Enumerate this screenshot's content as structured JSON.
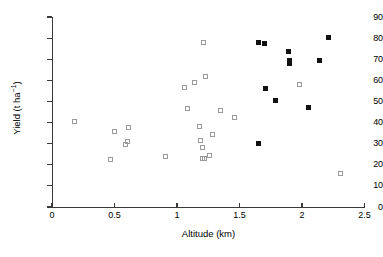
{
  "chart_data": {
    "type": "scatter",
    "title": "",
    "xlabel": "Altitude (km)",
    "ylabel": "Yield (t ha-1)",
    "ylabel_base": "Yield (t ha",
    "ylabel_sup": "−1",
    "ylabel_tail": ")",
    "xlim": [
      0,
      2.5
    ],
    "ylim": [
      0,
      90
    ],
    "xticks": [
      0,
      0.5,
      1,
      1.5,
      2,
      2.5
    ],
    "xtick_labels": [
      "0",
      "0.5",
      "1",
      "1.5",
      "2",
      "2.5"
    ],
    "yticks": [
      0,
      10,
      20,
      30,
      40,
      50,
      60,
      70,
      80,
      90
    ],
    "ytick_labels": [
      "0",
      "10",
      "20",
      "30",
      "40",
      "50",
      "60",
      "70",
      "80",
      "90"
    ],
    "grid": false,
    "legend": null,
    "series": [
      {
        "name": "open-squares",
        "marker": "open square",
        "color": "#9a9a9a",
        "points": [
          [
            0.18,
            40.5
          ],
          [
            0.47,
            22.6
          ],
          [
            0.5,
            35.7
          ],
          [
            0.59,
            29.6
          ],
          [
            0.6,
            31.2
          ],
          [
            0.61,
            37.6
          ],
          [
            0.91,
            24.0
          ],
          [
            1.06,
            56.8
          ],
          [
            1.08,
            46.8
          ],
          [
            1.14,
            58.8
          ],
          [
            1.18,
            38.0
          ],
          [
            1.19,
            31.6
          ],
          [
            1.2,
            28.4
          ],
          [
            1.2,
            22.8
          ],
          [
            1.21,
            78.0
          ],
          [
            1.22,
            23.2
          ],
          [
            1.23,
            61.6
          ],
          [
            1.26,
            24.6
          ],
          [
            1.28,
            34.2
          ],
          [
            1.35,
            45.6
          ],
          [
            1.46,
            42.3
          ],
          [
            1.98,
            58.2
          ],
          [
            2.31,
            16.1
          ]
        ]
      },
      {
        "name": "filled-squares",
        "marker": "filled square",
        "color": "#111111",
        "points": [
          [
            1.65,
            78.1
          ],
          [
            1.65,
            30.2
          ],
          [
            1.7,
            77.4
          ],
          [
            1.71,
            55.9
          ],
          [
            1.79,
            50.5
          ],
          [
            1.89,
            73.5
          ],
          [
            1.9,
            68.2
          ],
          [
            1.9,
            69.6
          ],
          [
            2.05,
            47.0
          ],
          [
            2.14,
            69.6
          ],
          [
            2.21,
            80.2
          ]
        ]
      }
    ]
  }
}
